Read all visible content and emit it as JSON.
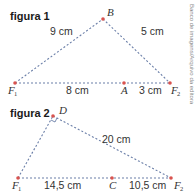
{
  "credit": "Banco de imagens/Arquivo da editora",
  "colors": {
    "segment": "#6b7fa8",
    "point": "#d9534f",
    "text": "#333333"
  },
  "figura1": {
    "title": "figura 1",
    "points": {
      "F1": {
        "label": "F",
        "sub": "1"
      },
      "B": {
        "label": "B"
      },
      "A": {
        "label": "A"
      },
      "F2": {
        "label": "F",
        "sub": "2"
      }
    },
    "measures": {
      "F1B": "9 cm",
      "BF2": "5 cm",
      "F1A": "8 cm",
      "AF2": "3 cm"
    }
  },
  "figura2": {
    "title": "figura 2",
    "points": {
      "D": {
        "label": "D"
      },
      "F1": {
        "label": "F",
        "sub": "1"
      },
      "C": {
        "label": "C"
      },
      "F2": {
        "label": "F",
        "sub": "2"
      }
    },
    "measures": {
      "DF2": "20 cm",
      "F1C": "14,5 cm",
      "CF2": "10,5 cm"
    },
    "right_angle_at": "D"
  }
}
